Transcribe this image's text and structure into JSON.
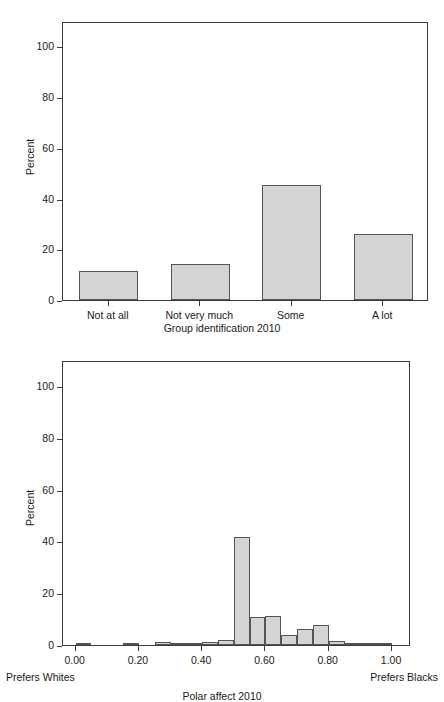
{
  "figures": [
    {
      "id": "group-identification-bar-chart",
      "ylabel": "Percent",
      "xlabel": "Group identification 2010",
      "yticks": [
        "0",
        "20",
        "40",
        "60",
        "80",
        "100"
      ],
      "chart_data": {
        "type": "bar",
        "title": "",
        "subtitle": "",
        "xlabel": "Group identification 2010",
        "ylabel": "Percent",
        "categories": [
          "Not at all",
          "Not very much",
          "Some",
          "A lot"
        ],
        "values": [
          11.5,
          14.2,
          45.3,
          26.0
        ],
        "ylim": [
          0,
          110
        ],
        "ytick_values": [
          0,
          20,
          40,
          60,
          80,
          100
        ],
        "grid": false,
        "legend": "none",
        "bar_fill": "#d4d4d4",
        "bar_edge": "#555555"
      }
    },
    {
      "id": "polar-affect-histogram",
      "ylabel": "Percent",
      "xlabel": "Polar affect 2010",
      "yticks": [
        "0",
        "20",
        "40",
        "60",
        "80",
        "100"
      ],
      "xticks": [
        "0.00",
        "0.20",
        "0.40",
        "0.60",
        "0.80",
        "1.00"
      ],
      "left_anchor": "Prefers Whites",
      "right_anchor": "Prefers Blacks",
      "chart_data": {
        "type": "bar",
        "title": "",
        "subtitle": "",
        "xlabel": "Polar affect 2010",
        "ylabel": "Percent",
        "ylim": [
          0,
          110
        ],
        "xlim": [
          -0.04,
          1.06
        ],
        "ytick_values": [
          0,
          20,
          40,
          60,
          80,
          100
        ],
        "xtick_values": [
          0.0,
          0.2,
          0.4,
          0.6,
          0.8,
          1.0
        ],
        "grid": false,
        "legend": "none",
        "bin_width": 0.05,
        "bin_starts": [
          0.0,
          0.05,
          0.1,
          0.15,
          0.2,
          0.25,
          0.3,
          0.35,
          0.4,
          0.45,
          0.5,
          0.55,
          0.6,
          0.65,
          0.7,
          0.75,
          0.8,
          0.85,
          0.9,
          0.95
        ],
        "values": [
          0.4,
          0.0,
          0.0,
          0.4,
          0.0,
          1.1,
          0.2,
          0.7,
          1.2,
          1.8,
          41.5,
          10.8,
          11.1,
          4.0,
          6.1,
          7.6,
          1.4,
          0.9,
          0.6,
          0.5
        ],
        "annotations": [
          {
            "text": "Prefers Whites",
            "position": "below-axis-left"
          },
          {
            "text": "Prefers Blacks",
            "position": "below-axis-right"
          }
        ],
        "bar_fill": "#d4d4d4",
        "bar_edge": "#555555"
      }
    }
  ]
}
